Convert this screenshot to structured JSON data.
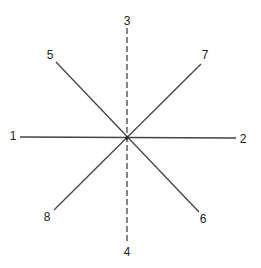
{
  "diagram": {
    "center": {
      "x": 127,
      "y": 138
    },
    "line_color": "#444444",
    "lines": [
      {
        "id": "1-2",
        "from": "1",
        "to": "2",
        "x1": 20,
        "y1": 137,
        "x2": 236,
        "y2": 138,
        "style": "solid"
      },
      {
        "id": "3-4",
        "from": "3",
        "to": "4",
        "x1": 127,
        "y1": 28,
        "x2": 127,
        "y2": 243,
        "style": "dashed"
      },
      {
        "id": "5-6",
        "from": "5",
        "to": "6",
        "x1": 56,
        "y1": 62,
        "x2": 199,
        "y2": 212,
        "style": "solid"
      },
      {
        "id": "7-8",
        "from": "7",
        "to": "8",
        "x1": 201,
        "y1": 64,
        "x2": 54,
        "y2": 210,
        "style": "solid"
      }
    ],
    "labels": [
      {
        "text": "1",
        "x": 13,
        "y": 140
      },
      {
        "text": "2",
        "x": 243,
        "y": 143
      },
      {
        "text": "3",
        "x": 127,
        "y": 25
      },
      {
        "text": "4",
        "x": 127,
        "y": 256
      },
      {
        "text": "5",
        "x": 50,
        "y": 59
      },
      {
        "text": "6",
        "x": 203,
        "y": 223
      },
      {
        "text": "7",
        "x": 205,
        "y": 59
      },
      {
        "text": "8",
        "x": 47,
        "y": 221
      }
    ]
  }
}
